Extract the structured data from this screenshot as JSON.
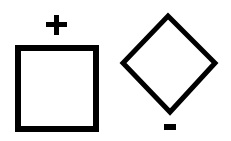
{
  "diagram": {
    "shapes": [
      {
        "id": "square",
        "type": "square",
        "label": "+",
        "label_position": "top"
      },
      {
        "id": "diamond",
        "type": "diamond",
        "label": "-",
        "label_position": "bottom"
      }
    ],
    "colors": {
      "stroke": "#000000",
      "background": "#ffffff"
    }
  }
}
